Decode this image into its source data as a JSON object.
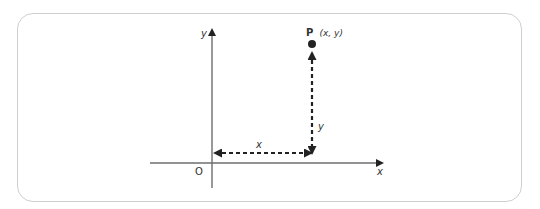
{
  "diagram": {
    "type": "cartesian-point",
    "colors": {
      "axis": "#6e6e6e",
      "dashed": "#222222",
      "point": "#222222",
      "frame": "#cfcfcf",
      "text": "#333333"
    },
    "axes": {
      "x_label": "x",
      "y_label": "y",
      "origin_label": "O"
    },
    "point": {
      "name": "P",
      "coords": "(x, y)"
    },
    "dimensions": {
      "horizontal_label": "x",
      "vertical_label": "y"
    }
  }
}
